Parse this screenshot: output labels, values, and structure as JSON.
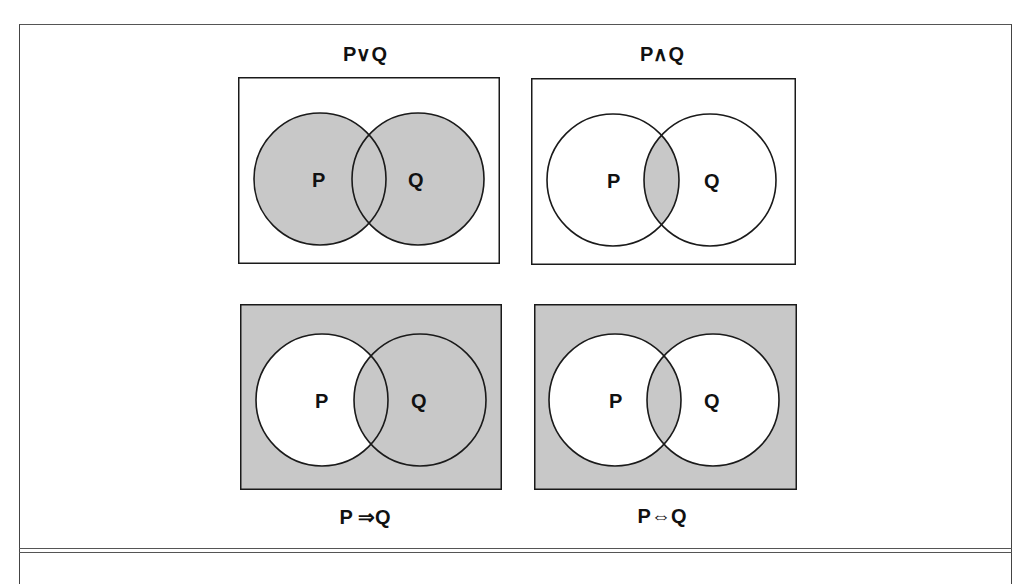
{
  "figure": {
    "panels": [
      {
        "id": "or",
        "title": "P∨Q",
        "operator": "disjunction",
        "title_position": "top",
        "shaded_regions": [
          "P",
          "Q"
        ],
        "background_shaded": false,
        "circle_labels": [
          "P",
          "Q"
        ]
      },
      {
        "id": "and",
        "title": "P∧Q",
        "operator": "conjunction",
        "title_position": "top",
        "shaded_regions": [
          "P∩Q"
        ],
        "background_shaded": false,
        "circle_labels": [
          "P",
          "Q"
        ]
      },
      {
        "id": "implies",
        "title": "P ⇒Q",
        "operator": "implication",
        "title_position": "bottom",
        "shaded_regions": [
          "Q",
          "outside"
        ],
        "background_shaded": true,
        "circle_labels": [
          "P",
          "Q"
        ]
      },
      {
        "id": "iff",
        "title": "P⇔Q",
        "operator": "biconditional",
        "title_position": "bottom",
        "shaded_regions": [
          "P∩Q",
          "outside"
        ],
        "background_shaded": true,
        "circle_labels": [
          "P",
          "Q"
        ]
      }
    ],
    "colors": {
      "shade": "#c8c8c8",
      "stroke": "#1a1a1a",
      "background": "#ffffff"
    }
  }
}
